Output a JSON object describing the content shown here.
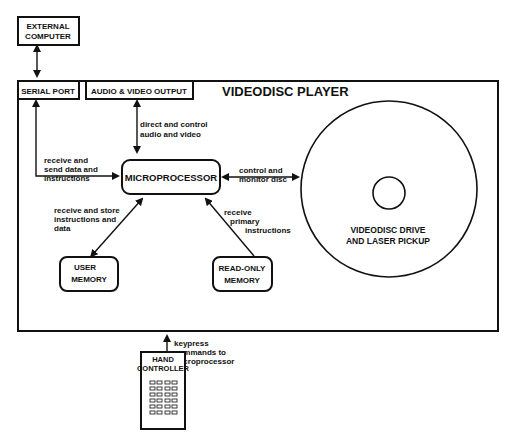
{
  "title": "VIDEODISC PLAYER",
  "blocks": {
    "external_computer": [
      "EXTERNAL",
      "COMPUTER"
    ],
    "serial_port": "SERIAL PORT",
    "av_output": "AUDIO & VIDEO OUTPUT",
    "microprocessor": "MICROPROCESSOR",
    "user_memory": [
      "USER",
      "MEMORY"
    ],
    "rom": [
      "READ-ONLY",
      "MEMORY"
    ],
    "disc_drive": [
      "VIDEODISC DRIVE",
      "AND LASER PICKUP"
    ],
    "hand_controller": [
      "HAND",
      "CONTROLLER"
    ]
  },
  "edges": {
    "av": [
      "direct and control",
      "audio and video"
    ],
    "serial": [
      "receive and",
      "send data and",
      "instructions"
    ],
    "disc": [
      "control and",
      "monitor disc"
    ],
    "user_mem": [
      "receive  and  store",
      "instructions and",
      "data"
    ],
    "rom": [
      "receive",
      "primary",
      "instructions"
    ],
    "keypress": [
      "keypress",
      "commands to",
      "microprocessor"
    ]
  },
  "colors": {
    "ink": "#111111",
    "background": "#ffffff"
  }
}
